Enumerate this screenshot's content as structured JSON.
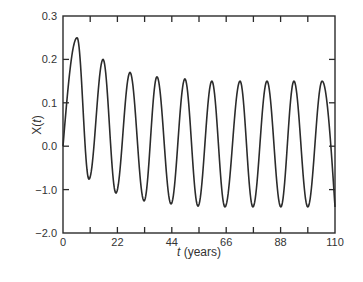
{
  "chart_data": {
    "type": "line",
    "title": "",
    "xlabel_italic": "t",
    "xlabel_rest": " (years)",
    "xlabel": "t (years)",
    "ylabel_prefix": "X(",
    "ylabel_var": "t",
    "ylabel_suffix": ")",
    "ylabel": "X(t)",
    "xlim": [
      0,
      110
    ],
    "x_ticks": [
      0,
      22,
      44,
      66,
      88,
      110
    ],
    "x_minor_ticks": [
      11,
      33,
      55,
      77,
      99
    ],
    "y_tick_labels": [
      "0.3",
      "0.2",
      "0.1",
      "0.0",
      "−1.0",
      "−2.0"
    ],
    "y_tick_values": [
      0.3,
      0.2,
      0.1,
      0.0,
      -1.0,
      -2.0
    ],
    "grid": false,
    "legend": null,
    "line_color": "#2b2b2b",
    "series": [
      {
        "name": "X(t)",
        "period_years": 11.1,
        "start": {
          "x": 0,
          "y": 0.0
        },
        "peaks": [
          {
            "x": 5.7,
            "y": 0.25
          },
          {
            "x": 16.2,
            "y": 0.2
          },
          {
            "x": 27.1,
            "y": 0.17
          },
          {
            "x": 38.0,
            "y": 0.16
          },
          {
            "x": 49.3,
            "y": 0.155
          },
          {
            "x": 60.2,
            "y": 0.15
          },
          {
            "x": 71.6,
            "y": 0.15
          },
          {
            "x": 82.5,
            "y": 0.15
          },
          {
            "x": 93.4,
            "y": 0.15
          },
          {
            "x": 104.8,
            "y": 0.15
          }
        ],
        "troughs": [
          {
            "x": 10.5,
            "y": -0.76
          },
          {
            "x": 21.4,
            "y": -1.08
          },
          {
            "x": 32.8,
            "y": -1.26
          },
          {
            "x": 43.7,
            "y": -1.33
          },
          {
            "x": 54.6,
            "y": -1.38
          },
          {
            "x": 65.5,
            "y": -1.4
          },
          {
            "x": 76.8,
            "y": -1.4
          },
          {
            "x": 88.1,
            "y": -1.4
          },
          {
            "x": 99.0,
            "y": -1.4
          }
        ],
        "end": {
          "x": 110,
          "y": -1.4
        }
      }
    ]
  }
}
